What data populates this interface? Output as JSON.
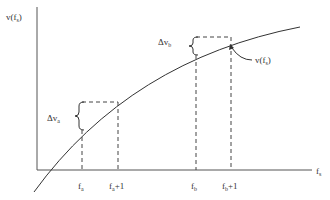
{
  "diagram": {
    "y_axis_label": {
      "main": "v(f",
      "sub": "s",
      "close": ")"
    },
    "x_axis_label": {
      "main": "f",
      "sub": "s"
    },
    "curve_label": {
      "main": "v(f",
      "sub": "s",
      "close": ")"
    },
    "delta_a": {
      "main": "Δv",
      "sub": "a"
    },
    "delta_b": {
      "main": "Δv",
      "sub": "b"
    },
    "ticks": [
      {
        "main": "f",
        "sub": "a",
        "suffix": ""
      },
      {
        "main": "f",
        "sub": "a",
        "suffix": "+1"
      },
      {
        "main": "f",
        "sub": "b",
        "suffix": ""
      },
      {
        "main": "f",
        "sub": "b",
        "suffix": "+1"
      }
    ],
    "colors": {
      "line": "#333333",
      "background": "#ffffff"
    }
  }
}
